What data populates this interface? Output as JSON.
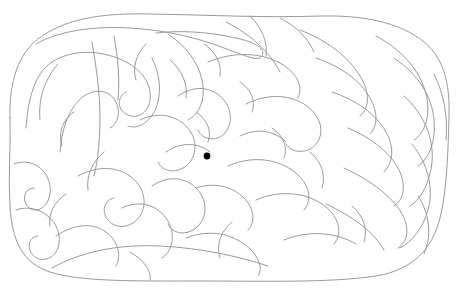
{
  "canvas": {
    "width": 456,
    "height": 302,
    "background_color": "#ffffff",
    "title": "Curvilinear blob maze puzzle"
  },
  "style": {
    "wall_color": "#9a9a9a",
    "wall_stroke_width": 1,
    "goal_color": "#000000"
  },
  "maze": {
    "kind": "organic-curvilinear-maze",
    "outline_bounds": {
      "x": 8,
      "y": 12,
      "width": 442,
      "height": 270
    },
    "goal_marker": {
      "label": "maze-center-dot",
      "cx": 207,
      "cy": 156,
      "r": 3.4,
      "color": "#000000"
    },
    "walls": [
      "M 10 118 C 9 82 18 52 42 36 C 70 17 108 13 150 14 C 210 15 268 18 320 16 C 362 15 400 22 424 42 C 444 58 450 84 449 116 C 448 152 447 190 440 218 C 432 250 412 270 376 276 C 330 283 262 281 200 281 C 140 281 80 282 50 272 C 22 263 12 240 10 206 C 8 176 11 146 10 118 Z",
      "M 36 44 C 60 30 96 26 130 28 C 166 30 198 38 224 48 C 246 56 258 62 262 56 C 266 48 254 42 236 38 C 210 32 180 30 156 33",
      "M 26 128 C 28 100 34 74 52 62 C 72 49 100 50 122 60 C 142 69 152 84 150 100 C 148 114 136 120 126 114 C 116 108 118 96 126 92",
      "M 60 152 C 62 126 70 106 84 96 C 96 88 110 90 116 102 C 121 112 118 124 110 128",
      "M 92 42 C 96 66 100 92 100 118 C 100 140 98 160 94 176",
      "M 114 36 C 118 58 120 80 118 100",
      "M 14 164 C 24 160 36 162 44 172 C 52 182 52 196 46 204 C 40 212 30 212 26 204 C 22 196 26 188 34 188",
      "M 16 210 C 26 206 40 208 50 218 C 60 228 62 242 56 252 C 50 261 38 262 32 254 C 26 246 30 236 38 236",
      "M 56 236 C 74 224 92 222 106 232 C 118 241 122 256 116 266",
      "M 52 268 C 80 252 118 244 160 246 C 200 248 238 256 268 266",
      "M 78 176 C 96 166 116 166 130 176 C 144 186 148 204 140 216 C 132 228 116 230 108 220 C 101 212 104 200 114 198",
      "M 140 120 C 156 112 174 114 186 126 C 198 138 198 156 186 166 C 176 174 162 172 158 162",
      "M 152 58 C 160 74 162 92 156 108 C 150 122 138 130 128 126",
      "M 168 34 C 186 46 198 62 202 80 C 206 98 200 114 188 120",
      "M 178 96 C 192 86 208 86 220 96 C 232 106 234 124 224 134 C 216 142 202 140 198 130",
      "M 166 152 C 180 142 198 142 210 152",
      "M 152 186 C 166 176 184 176 196 188 C 208 200 208 218 196 228 C 186 236 172 234 168 224",
      "M 122 208 C 138 200 156 204 166 218 C 176 232 174 250 162 258",
      "M 196 188 C 214 182 232 186 244 198 C 254 208 256 222 248 230",
      "M 186 238 C 206 230 228 232 244 244 C 258 254 264 268 258 276",
      "M 208 62 C 232 52 258 52 278 62 C 296 71 304 86 298 98",
      "M 226 22 C 250 34 270 52 280 72",
      "M 246 104 C 266 94 288 94 304 104 C 320 114 326 132 316 144 C 308 154 292 154 286 144",
      "M 240 136 C 256 128 274 130 286 142",
      "M 228 166 C 250 156 274 158 292 170 C 308 181 314 198 304 210",
      "M 256 200 C 278 190 304 192 322 204 C 338 215 344 232 334 244",
      "M 284 240 C 308 230 336 232 356 244",
      "M 300 30 C 326 40 348 56 360 76 C 370 92 370 108 360 116",
      "M 316 58 C 340 66 360 80 370 98 C 378 112 378 126 370 134",
      "M 332 92 C 356 100 376 114 386 132 C 394 146 394 162 384 172",
      "M 348 128 C 372 138 392 154 400 172 C 406 186 404 200 394 206",
      "M 344 168 C 370 180 392 196 402 214 C 410 228 408 242 398 248",
      "M 326 204 C 352 216 374 232 384 250",
      "M 376 36 C 402 50 420 70 426 94 C 431 114 426 132 414 140",
      "M 394 58 C 418 74 432 96 434 120 C 436 140 430 158 418 166",
      "M 404 96 C 424 114 434 138 432 162 C 430 182 422 198 410 206",
      "M 412 144 C 428 164 434 188 428 210 C 423 228 412 242 400 248",
      "M 418 196 C 430 214 432 236 424 254",
      "M 434 74 C 444 94 448 116 446 140",
      "M 250 16 C 262 28 268 42 266 56",
      "M 280 18 C 296 26 308 38 314 52",
      "M 58 64 C 44 80 38 100 40 120",
      "M 170 60 C 182 70 188 84 186 98",
      "M 104 152 C 92 162 86 176 88 190",
      "M 196 112 C 208 120 212 132 208 142",
      "M 232 222 C 220 232 216 246 220 258",
      "M 130 252 C 144 260 152 272 150 280",
      "M 66 194 C 54 202 48 214 50 226",
      "M 272 128 C 284 136 288 148 284 158",
      "M 352 206 C 364 216 368 230 364 242",
      "M 146 44 C 136 54 132 68 136 80",
      "M 204 44 C 216 52 222 64 220 76",
      "M 310 152 C 322 162 326 176 322 188",
      "M 74 112 C 62 120 58 134 62 146",
      "M 240 82 C 252 90 256 102 252 112"
    ]
  },
  "legend": {
    "goal_label": "center dot",
    "entrance_label": "maze border",
    "description": "A single black dot marks the maze center; no text labels appear in the image."
  }
}
